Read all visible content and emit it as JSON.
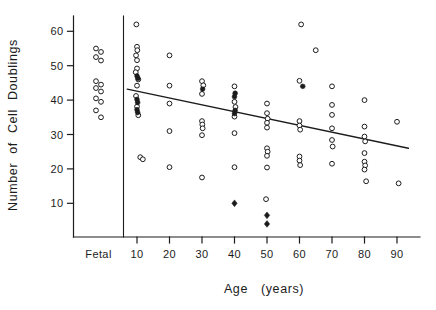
{
  "figure": {
    "background": "#ffffff",
    "ink_color": "#1c1c1c"
  },
  "chart_data": {
    "type": "scatter",
    "title": "",
    "xlabel": "Age (years)",
    "ylabel": "Number of Cell Doublings",
    "legend_position": "none",
    "grid": false,
    "x_axis": {
      "fetal_label": "Fetal",
      "numeric_ticks": [
        10,
        20,
        30,
        40,
        50,
        60,
        70,
        80,
        90
      ],
      "numeric_tick_labels": [
        "10",
        "20",
        "30",
        "40",
        "50",
        "60",
        "70",
        "80",
        "90"
      ],
      "range_years": [
        4,
        97
      ]
    },
    "y_axis": {
      "ticks": [
        10,
        20,
        30,
        40,
        50,
        60
      ],
      "tick_labels": [
        "10",
        "20",
        "30",
        "40",
        "50",
        "60"
      ],
      "range": [
        2,
        64
      ]
    },
    "separator_line_x_years": 6,
    "fetal_series": {
      "marker": "open-circle",
      "values": [
        55,
        54,
        52.5,
        51.5,
        45.5,
        44.5,
        43.5,
        42.5,
        40.5,
        39.5,
        37,
        35
      ]
    },
    "series": [
      {
        "name": "open-circle-points",
        "marker": "open-circle",
        "points": [
          [
            9.8,
            62
          ],
          [
            10,
            55.5
          ],
          [
            10.1,
            54.5
          ],
          [
            9.7,
            53
          ],
          [
            10,
            51.6
          ],
          [
            10,
            49.2
          ],
          [
            9.6,
            48.1
          ],
          [
            10.4,
            46
          ],
          [
            10,
            44.2
          ],
          [
            9.7,
            41.2
          ],
          [
            10,
            38.1
          ],
          [
            10.4,
            35.6
          ],
          [
            11,
            23.4
          ],
          [
            11.8,
            22.8
          ],
          [
            20,
            53
          ],
          [
            20,
            44.2
          ],
          [
            20,
            39
          ],
          [
            20,
            31
          ],
          [
            20,
            20.5
          ],
          [
            30,
            45.5
          ],
          [
            30.4,
            44.3
          ],
          [
            30,
            41.8
          ],
          [
            30,
            33.9
          ],
          [
            30.1,
            32.9
          ],
          [
            30.2,
            31.8
          ],
          [
            30,
            29.8
          ],
          [
            30,
            17.5
          ],
          [
            40,
            44
          ],
          [
            40,
            39.5
          ],
          [
            40.3,
            38
          ],
          [
            40,
            35.2
          ],
          [
            40,
            30.4
          ],
          [
            40,
            20.5
          ],
          [
            50,
            39
          ],
          [
            50,
            36.2
          ],
          [
            50.2,
            34.6
          ],
          [
            50,
            33.4
          ],
          [
            50,
            32
          ],
          [
            50,
            26
          ],
          [
            50.2,
            25
          ],
          [
            50,
            23.8
          ],
          [
            50,
            20.4
          ],
          [
            49.7,
            11.2
          ],
          [
            60.5,
            62
          ],
          [
            65,
            54.5
          ],
          [
            60,
            45.6
          ],
          [
            60,
            33.9
          ],
          [
            60,
            32.6
          ],
          [
            60.2,
            31.4
          ],
          [
            60,
            23.6
          ],
          [
            60,
            22.4
          ],
          [
            60.2,
            21.1
          ],
          [
            70,
            44
          ],
          [
            70,
            38.6
          ],
          [
            70,
            35.7
          ],
          [
            70,
            31.8
          ],
          [
            70,
            28.4
          ],
          [
            70.2,
            26.5
          ],
          [
            70,
            21.5
          ],
          [
            80,
            40
          ],
          [
            80,
            32.3
          ],
          [
            80,
            29.4
          ],
          [
            80.2,
            28
          ],
          [
            80,
            24.6
          ],
          [
            80,
            22.1
          ],
          [
            80.2,
            21
          ],
          [
            80,
            19.8
          ],
          [
            80.5,
            16.4
          ],
          [
            90,
            33.7
          ],
          [
            90.5,
            15.8
          ]
        ]
      },
      {
        "name": "filled-circle-points",
        "marker": "filled-circle",
        "points": [
          [
            10,
            47
          ],
          [
            10.3,
            46.3
          ],
          [
            10,
            40.2
          ],
          [
            10.2,
            39.3
          ],
          [
            10,
            37.2
          ],
          [
            10.2,
            36.4
          ],
          [
            30.2,
            43.2
          ],
          [
            40.2,
            42
          ],
          [
            40,
            41
          ],
          [
            40.2,
            37
          ],
          [
            40,
            36.1
          ],
          [
            61,
            44
          ]
        ]
      },
      {
        "name": "filled-diamond-points",
        "marker": "filled-diamond",
        "points": [
          [
            40,
            10
          ],
          [
            50,
            6.5
          ],
          [
            50,
            4
          ]
        ]
      }
    ],
    "trend_line": {
      "x1": 7,
      "y1": 43.2,
      "x2": 93.5,
      "y2": 26
    }
  }
}
